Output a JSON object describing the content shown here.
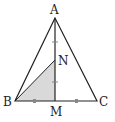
{
  "diagram": {
    "type": "geometry",
    "points": {
      "A": {
        "label": "A",
        "x": 55,
        "y": 18
      },
      "B": {
        "label": "B",
        "x": 15,
        "y": 101
      },
      "C": {
        "label": "C",
        "x": 97,
        "y": 101
      },
      "M": {
        "label": "M",
        "x": 55,
        "y": 101
      },
      "N": {
        "label": "N",
        "x": 55,
        "y": 60
      }
    },
    "segments": [
      "AB",
      "AC",
      "BC",
      "AM",
      "BN"
    ],
    "shaded_region": "BMN",
    "tick_marks": {
      "AN_NM_equal": "single tick on AN and NM",
      "BM_MC_equal": "single tick on BM and MC"
    },
    "colors": {
      "stroke": "#222222",
      "shade": "#d9d9d9",
      "tick": "#888888"
    }
  }
}
